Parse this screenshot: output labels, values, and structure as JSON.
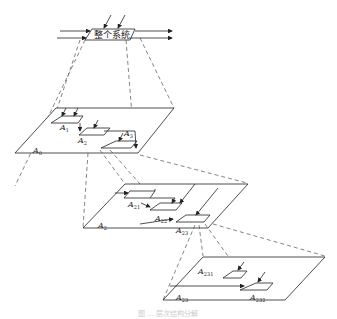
{
  "diagram": {
    "type": "hierarchical-decomposition",
    "top_box": {
      "label": "整个系统"
    },
    "levels": [
      {
        "plane_label": "A",
        "plane_sub": "0",
        "boxes": [
          {
            "label": "A",
            "sub": "1"
          },
          {
            "label": "A",
            "sub": "2"
          },
          {
            "label": "A",
            "sub": "3"
          }
        ]
      },
      {
        "plane_label": "A",
        "plane_sub": "2",
        "boxes": [
          {
            "label": "A",
            "sub": "21"
          },
          {
            "label": "A",
            "sub": "22"
          },
          {
            "label": "A",
            "sub": "23"
          }
        ]
      },
      {
        "plane_label": "A",
        "plane_sub": "23",
        "boxes": [
          {
            "label": "A",
            "sub": "231"
          },
          {
            "label": "A",
            "sub": "232"
          }
        ]
      }
    ],
    "caption": "图 ... 层次结构分解"
  }
}
